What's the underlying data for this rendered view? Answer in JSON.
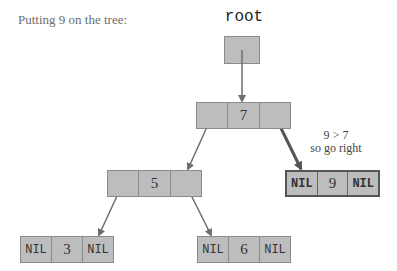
{
  "caption": "Putting 9 on the tree:",
  "root_label": "root",
  "note": {
    "line1": "9 > 7",
    "line2": "so go right"
  },
  "nodes": {
    "n7": {
      "left": "",
      "value": "7",
      "right": ""
    },
    "n5": {
      "left": "",
      "value": "5",
      "right": ""
    },
    "n9": {
      "left": "NIL",
      "value": "9",
      "right": "NIL"
    },
    "n3": {
      "left": "NIL",
      "value": "3",
      "right": "NIL"
    },
    "n6": {
      "left": "NIL",
      "value": "6",
      "right": "NIL"
    }
  },
  "colors": {
    "node_fill": "#bdbdbd",
    "node_border": "#8a8a8a",
    "arrow": "#6e6e6e",
    "highlight_arrow": "#555555"
  }
}
